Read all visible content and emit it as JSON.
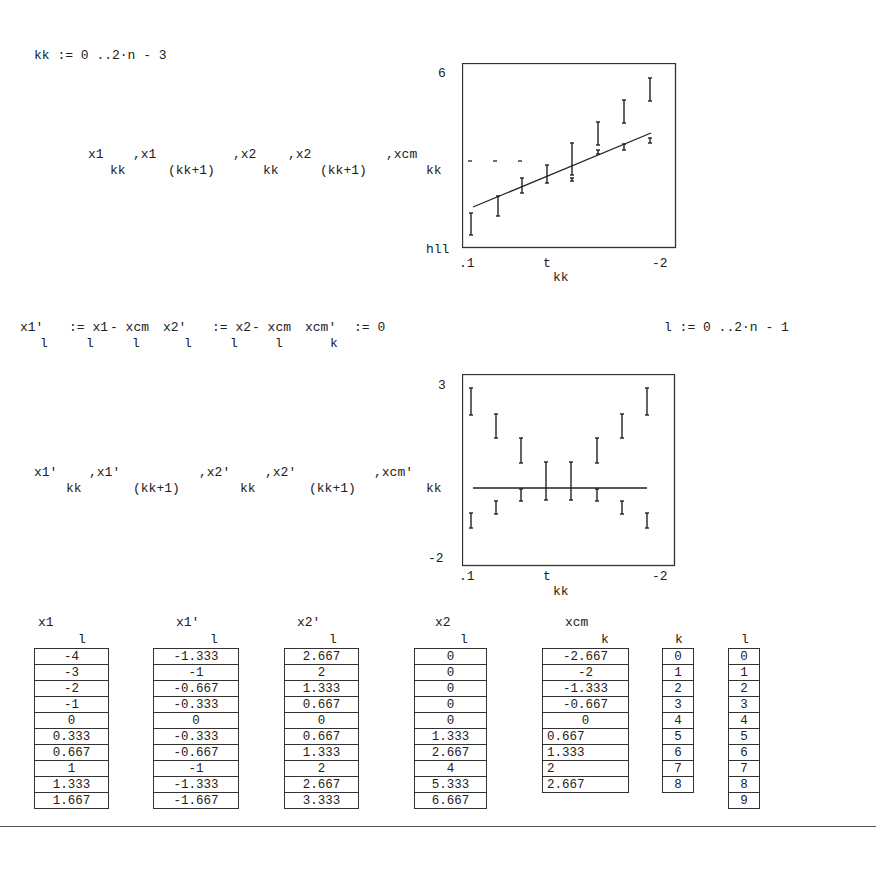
{
  "definitions": {
    "range_kk": "kk := 0 ..2·n - 3",
    "x1p_lhs": "x1'",
    "x1p_lhs_sub": "l",
    "x1p_rhs": ":= x1",
    "x1p_rhs_sub": "l",
    "x1p_minus": "- xcm",
    "x1p_minus_sub": "l",
    "x2p_lhs": "x2'",
    "x2p_lhs_sub": "l",
    "x2p_rhs": ":= x2",
    "x2p_rhs_sub": "l",
    "x2p_minus": "- xcm",
    "x2p_minus_sub": "l",
    "xcmp_lhs": "xcm'",
    "xcmp_lhs_sub": "k",
    "xcmp_rhs": ":= 0",
    "range_l": "l := 0 ..2·n - 1"
  },
  "plot1": {
    "y_expr": [
      {
        "base": "x1",
        "sub": "kk"
      },
      {
        "base": ",x1",
        "sub": "(kk+1)"
      },
      {
        "base": ",x2",
        "sub": "kk"
      },
      {
        "base": ",x2",
        "sub": "(kk+1)"
      },
      {
        "base": ",xcm",
        "sub": "kk"
      }
    ],
    "y_top": "6",
    "y_bottom": "hll",
    "x_left": ".1",
    "x_mid": "t",
    "x_right": "-2",
    "x_label": "kk"
  },
  "plot2": {
    "y_expr": [
      {
        "base": "x1'",
        "sub": "kk"
      },
      {
        "base": ",x1'",
        "sub": "(kk+1)"
      },
      {
        "base": ",x2'",
        "sub": "kk"
      },
      {
        "base": ",x2'",
        "sub": "(kk+1)"
      },
      {
        "base": ",xcm'",
        "sub": "kk"
      }
    ],
    "y_top": "3",
    "y_bottom": "-2",
    "x_left": ".1",
    "x_mid": "t",
    "x_right": "-2",
    "x_label": "kk"
  },
  "chart_data": [
    {
      "type": "line",
      "title": "",
      "xlabel": "kk",
      "ylabel": "x1, x2, xcm",
      "ylim": [
        -2,
        6
      ],
      "x": [
        0,
        1,
        2,
        3,
        4,
        5,
        6,
        7
      ],
      "series": [
        {
          "name": "x1 segments (kk to kk+1)",
          "values": [
            [
              -4,
              -3
            ],
            [
              -3,
              -2
            ],
            [
              -2,
              -1
            ],
            [
              -1,
              0
            ],
            [
              0,
              0.333
            ],
            [
              0.333,
              0.667
            ],
            [
              0.667,
              1
            ],
            [
              1,
              1.333
            ]
          ]
        },
        {
          "name": "x2 segments (kk to kk+1)",
          "values": [
            [
              0,
              0
            ],
            [
              0,
              0
            ],
            [
              0,
              0
            ],
            [
              0,
              0
            ],
            [
              0,
              1.333
            ],
            [
              1.333,
              2.667
            ],
            [
              2.667,
              4
            ],
            [
              4,
              5.333
            ]
          ]
        },
        {
          "name": "xcm",
          "values": [
            -2.667,
            -2,
            -1.333,
            -0.667,
            0,
            0.667,
            1.333,
            2
          ]
        }
      ],
      "tick_labels": {
        "y": [
          "6",
          "hll"
        ],
        "x": [
          ".1",
          "t",
          "-2"
        ]
      },
      "grid": false
    },
    {
      "type": "line",
      "title": "",
      "xlabel": "kk",
      "ylabel": "x1', x2', xcm'",
      "ylim": [
        -2,
        3
      ],
      "x": [
        0,
        1,
        2,
        3,
        4,
        5,
        6,
        7
      ],
      "series": [
        {
          "name": "x1' segments",
          "values": [
            [
              -1.333,
              -1
            ],
            [
              -1,
              -0.667
            ],
            [
              -0.667,
              -0.333
            ],
            [
              -0.333,
              0
            ],
            [
              0,
              -0.333
            ],
            [
              -0.333,
              -0.667
            ],
            [
              -0.667,
              -1
            ],
            [
              -1,
              -1.333
            ]
          ]
        },
        {
          "name": "x2' segments",
          "values": [
            [
              2.667,
              2
            ],
            [
              2,
              1.333
            ],
            [
              1.333,
              0.667
            ],
            [
              0.667,
              0
            ],
            [
              0,
              0.667
            ],
            [
              0.667,
              1.333
            ],
            [
              1.333,
              2
            ],
            [
              2,
              2.667
            ]
          ]
        },
        {
          "name": "xcm'",
          "values": [
            0,
            0,
            0,
            0,
            0,
            0,
            0,
            0
          ]
        }
      ],
      "tick_labels": {
        "y": [
          "3",
          "-2"
        ],
        "x": [
          ".1",
          "t",
          "-2"
        ]
      },
      "grid": false
    }
  ],
  "plot_geometry": {
    "p1": {
      "left": 462,
      "top": 63,
      "width": 213,
      "height": 184,
      "bars": [
        [
          9,
          150,
          172
        ],
        [
          36,
          133,
          153
        ],
        [
          60,
          115,
          130
        ],
        [
          85,
          102,
          120
        ],
        [
          110,
          80,
          112
        ],
        [
          136,
          59,
          82
        ],
        [
          162,
          37,
          60
        ],
        [
          188,
          15,
          38
        ]
      ],
      "small_bars": [
        [
          110,
          115,
          118
        ],
        [
          136,
          87,
          91
        ],
        [
          162,
          81,
          87
        ],
        [
          188,
          75,
          80
        ]
      ],
      "dashes": [
        [
          6,
          98
        ],
        [
          31,
          98
        ],
        [
          56,
          98
        ]
      ],
      "line": [
        11,
        144,
        189,
        70
      ]
    },
    "p2": {
      "left": 462,
      "top": 374,
      "width": 212,
      "height": 191,
      "bars": [
        [
          9,
          14,
          41
        ],
        [
          34,
          40,
          64
        ],
        [
          59,
          64,
          89
        ],
        [
          84,
          88,
          126
        ],
        [
          109,
          88,
          126
        ],
        [
          135,
          64,
          89
        ],
        [
          160,
          40,
          64
        ],
        [
          185,
          14,
          41
        ],
        [
          9,
          139,
          154
        ],
        [
          34,
          127,
          140
        ],
        [
          59,
          115,
          127
        ],
        [
          135,
          115,
          127
        ],
        [
          160,
          127,
          140
        ],
        [
          185,
          139,
          154
        ]
      ],
      "line": [
        11,
        114,
        185,
        114
      ]
    }
  },
  "tables": [
    {
      "name": "x1",
      "sub": "l",
      "values": [
        "-4",
        "-3",
        "-2",
        "-1",
        "0",
        "0.333",
        "0.667",
        "1",
        "1.333",
        "1.667"
      ]
    },
    {
      "name": "x1'",
      "sub": "l",
      "values": [
        "-1.333",
        "-1",
        "-0.667",
        "-0.333",
        "0",
        "-0.333",
        "-0.667",
        "-1",
        "-1.333",
        "-1.667"
      ]
    },
    {
      "name": "x2'",
      "sub": "l",
      "values": [
        "2.667",
        "2",
        "1.333",
        "0.667",
        "0",
        "0.667",
        "1.333",
        "2",
        "2.667",
        "3.333"
      ]
    },
    {
      "name": "x2",
      "sub": "l",
      "values": [
        "0",
        "0",
        "0",
        "0",
        "0",
        "1.333",
        "2.667",
        "4",
        "5.333",
        "6.667"
      ]
    },
    {
      "name": "xcm",
      "sub": "k",
      "values": [
        "-2.667",
        "-2",
        "-1.333",
        "-0.667",
        "0",
        "0.667",
        "1.333",
        "2",
        "2.667"
      ]
    },
    {
      "name": "",
      "sub": "k",
      "values": [
        "0",
        "1",
        "2",
        "3",
        "4",
        "5",
        "6",
        "7",
        "8"
      ]
    },
    {
      "name": "",
      "sub": "l",
      "values": [
        "0",
        "1",
        "2",
        "3",
        "4",
        "5",
        "6",
        "7",
        "8",
        "9"
      ]
    }
  ]
}
